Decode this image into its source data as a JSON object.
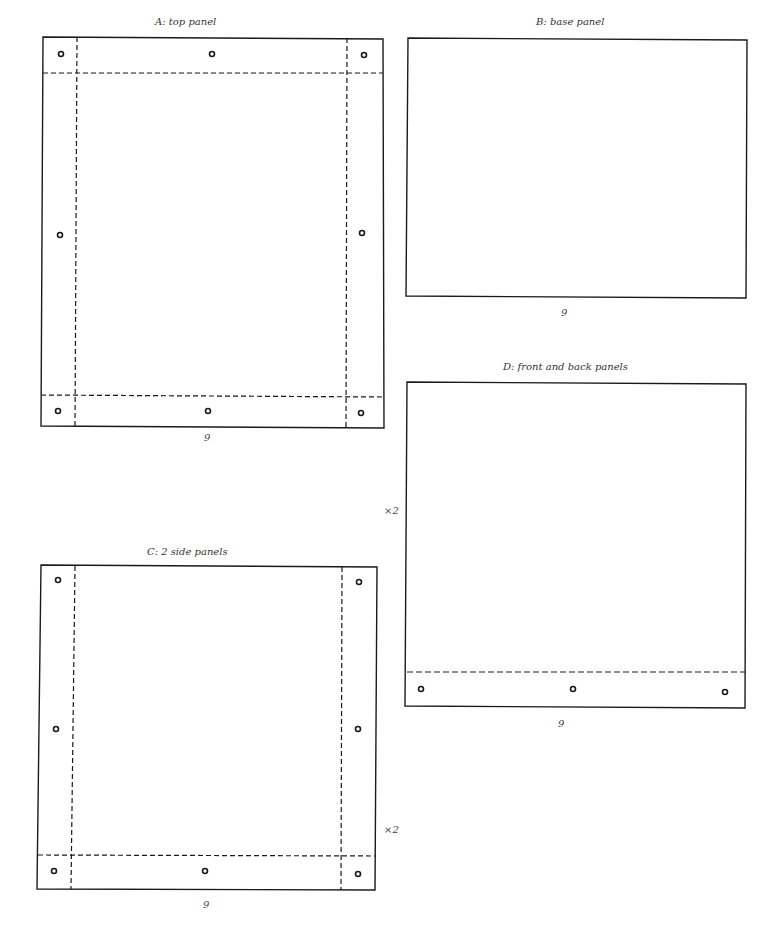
{
  "panels": {
    "a": {
      "title": "A: top panel",
      "width_label": "9"
    },
    "b": {
      "title": "B: base panel",
      "width_label": "9"
    },
    "c": {
      "title": "C: 2 side panels",
      "width_label": "9",
      "quantity": "×2"
    },
    "d": {
      "title": "D: front and back panels",
      "width_label": "9",
      "quantity": "×2"
    }
  },
  "colors": {
    "line": "#1a1a1a",
    "fold": "#1a1a1a",
    "text": "#333333"
  }
}
